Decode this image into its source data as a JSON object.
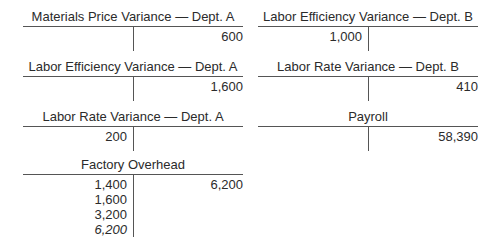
{
  "accounts": [
    {
      "title": "Materials Price Variance — Dept. A",
      "debits": [],
      "credits": [
        "600"
      ]
    },
    {
      "title": "Labor Efficiency Variance — Dept. B",
      "debits": [
        "1,000"
      ],
      "credits": []
    },
    {
      "title": "Labor Efficiency Variance — Dept. A",
      "debits": [],
      "credits": [
        "1,600"
      ]
    },
    {
      "title": "Labor Rate Variance — Dept. B",
      "debits": [],
      "credits": [
        "410"
      ]
    },
    {
      "title": "Labor Rate Variance — Dept. A",
      "debits": [
        "200"
      ],
      "credits": []
    },
    {
      "title": "Payroll",
      "debits": [],
      "credits": [
        "58,390"
      ]
    },
    {
      "title": "Factory Overhead",
      "debits": [
        "1,400",
        "1,600",
        "3,200",
        "6,200"
      ],
      "credits": [
        "6,200"
      ],
      "italic_debit_index": 3
    }
  ]
}
